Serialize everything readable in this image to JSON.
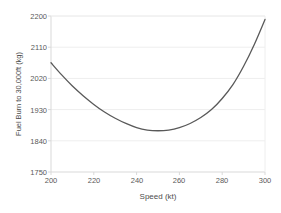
{
  "chart_data": {
    "type": "line",
    "title": "",
    "xlabel": "Speed (kt)",
    "ylabel": "Fuel Burn to 30,000ft (kg)",
    "xlim": [
      200,
      300
    ],
    "ylim": [
      1750,
      2200
    ],
    "xticks": [
      200,
      220,
      240,
      260,
      280,
      300
    ],
    "yticks": [
      1750,
      1840,
      1930,
      2020,
      2110,
      2200
    ],
    "grid": true,
    "legend": false,
    "legend_position": "none",
    "series": [
      {
        "name": "Fuel Burn",
        "color": "#595959",
        "x": [
          200,
          205,
          210,
          215,
          220,
          225,
          230,
          235,
          240,
          245,
          250,
          255,
          260,
          265,
          270,
          275,
          280,
          285,
          290,
          295,
          300
        ],
        "values": [
          2065,
          2030,
          1998,
          1970,
          1945,
          1923,
          1905,
          1890,
          1878,
          1871,
          1869,
          1871,
          1878,
          1890,
          1907,
          1930,
          1962,
          2002,
          2055,
          2118,
          2190
        ]
      }
    ],
    "annotations": []
  },
  "axes": {
    "y_tick_labels": [
      "2200",
      "2110",
      "2020",
      "1930",
      "1840",
      "1750"
    ],
    "x_tick_labels": [
      "200",
      "220",
      "240",
      "260",
      "280",
      "300"
    ],
    "y_title": "Fuel Burn to 30,000ft (kg)",
    "x_title": "Speed (kt)"
  },
  "style": {
    "background": "#ffffff",
    "line_color": "#595959",
    "grid_color": "#eeeeee",
    "axis_color": "#d9d9d9",
    "tick_text_color": "#595959"
  }
}
